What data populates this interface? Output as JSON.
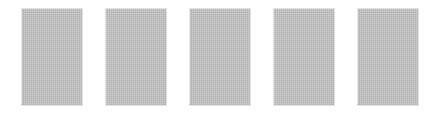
{
  "thumbnails": {
    "count": 5,
    "fill_color": "#bdbdbd",
    "items": [
      {
        "index": 1,
        "left": 22
      },
      {
        "index": 2,
        "left": 106
      },
      {
        "index": 3,
        "left": 190
      },
      {
        "index": 4,
        "left": 274
      },
      {
        "index": 5,
        "left": 358
      }
    ]
  }
}
